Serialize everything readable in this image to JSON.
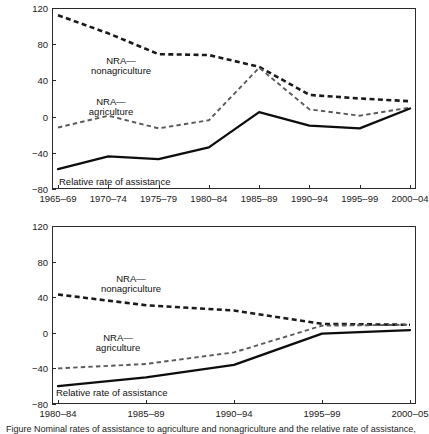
{
  "figure": {
    "caption": "Figure  Nominal rates of assistance to agriculture and nonagriculture and the relative rate of assistance, India and China"
  },
  "chart_data": [
    {
      "id": "india",
      "type": "line",
      "title": "",
      "xlabel": "",
      "ylabel": "India, rate of assistance (%)",
      "categories": [
        "1965–69",
        "1970–74",
        "1975–79",
        "1980–84",
        "1985–89",
        "1990–94",
        "1995–99",
        "2000–04"
      ],
      "ylim": [
        -80,
        120
      ],
      "yticks": [
        120,
        80,
        40,
        0,
        -40,
        -80
      ],
      "grid": false,
      "legend_position": "inline-annotations",
      "series": [
        {
          "name": "NRA—nonagriculture",
          "style": "dashed-heavy",
          "color": "#1a1a1a",
          "values": [
            112,
            92,
            69,
            68,
            55,
            24,
            20,
            17
          ]
        },
        {
          "name": "NRA—agriculture",
          "style": "dashed-light",
          "color": "#5a5a5a",
          "values": [
            -12,
            1,
            -13,
            -4,
            54,
            8,
            1,
            10
          ]
        },
        {
          "name": "Relative rate of assistance",
          "style": "solid",
          "color": "#0d0d0d",
          "values": [
            -58,
            -44,
            -47,
            -34,
            5,
            -10,
            -13,
            9
          ]
        }
      ],
      "annotations": [
        {
          "text_line1": "NRA—",
          "text_line2": "nonagriculture"
        },
        {
          "text_line1": "NRA—",
          "text_line2": "agriculture"
        },
        {
          "text_line1": "Relative rate of assistance",
          "text_line2": ""
        }
      ]
    },
    {
      "id": "china",
      "type": "line",
      "title": "",
      "xlabel": "",
      "ylabel": "China, rate of assistance (%)",
      "categories": [
        "1980–84",
        "1985–89",
        "1990–94",
        "1995–99",
        "2000–05"
      ],
      "ylim": [
        -80,
        120
      ],
      "yticks": [
        120,
        80,
        40,
        0,
        -40,
        -80
      ],
      "grid": false,
      "legend_position": "inline-annotations",
      "series": [
        {
          "name": "NRA—nonagriculture",
          "style": "dashed-heavy",
          "color": "#1a1a1a",
          "values": [
            43,
            31,
            25,
            10,
            9
          ]
        },
        {
          "name": "NRA—agriculture",
          "style": "dashed-light",
          "color": "#5a5a5a",
          "values": [
            -40,
            -35,
            -22,
            8,
            9
          ]
        },
        {
          "name": "Relative rate of assistance",
          "style": "solid",
          "color": "#0d0d0d",
          "values": [
            -60,
            -50,
            -36,
            -1,
            3
          ]
        }
      ],
      "annotations": [
        {
          "text_line1": "NRA—",
          "text_line2": "nonagriculture"
        },
        {
          "text_line1": "NRA—",
          "text_line2": "agriculture"
        },
        {
          "text_line1": "Relative rate of assistance",
          "text_line2": ""
        }
      ]
    }
  ]
}
